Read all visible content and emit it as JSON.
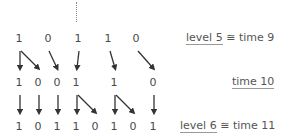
{
  "diagram": {
    "ellipsis": "⋮",
    "rows": [
      {
        "name": "level-5",
        "y": 33,
        "digits": [
          {
            "v": "1",
            "x": 19
          },
          {
            "v": "0",
            "x": 48
          },
          {
            "v": "1",
            "x": 78
          },
          {
            "v": "1",
            "x": 108
          },
          {
            "v": "0",
            "x": 136
          }
        ],
        "label": {
          "prefix": "level",
          "num": "5",
          "rel": "≅ time 9",
          "x": 186
        }
      },
      {
        "name": "time-10",
        "y": 77,
        "digits": [
          {
            "v": "1",
            "x": 19
          },
          {
            "v": "0",
            "x": 38
          },
          {
            "v": "0",
            "x": 57
          },
          {
            "v": "1",
            "x": 76
          },
          {
            "v": "1",
            "x": 114
          },
          {
            "v": "0",
            "x": 153
          }
        ],
        "label": {
          "text": "time 10",
          "x": 232
        }
      },
      {
        "name": "level-6",
        "y": 121,
        "digits": [
          {
            "v": "1",
            "x": 19
          },
          {
            "v": "0",
            "x": 38
          },
          {
            "v": "1",
            "x": 57
          },
          {
            "v": "1",
            "x": 76
          },
          {
            "v": "0",
            "x": 95
          },
          {
            "v": "1",
            "x": 114
          },
          {
            "v": "0",
            "x": 133
          },
          {
            "v": "1",
            "x": 153
          }
        ],
        "label": {
          "prefix": "level",
          "num": "6",
          "rel": "≅ time 11",
          "x": 180
        }
      }
    ],
    "labels": {
      "level5_prefix": "level",
      "level5_num": "5",
      "level5_rel": "≅ time 9",
      "time10": "time 10",
      "level6_prefix": "level",
      "level6_num": "6",
      "level6_rel": "≅ time 11"
    },
    "digits_row1": [
      "1",
      "0",
      "1",
      "1",
      "0"
    ],
    "digits_row2": [
      "1",
      "0",
      "0",
      "1",
      "1",
      "0"
    ],
    "digits_row3": [
      "1",
      "0",
      "1",
      "1",
      "0",
      "1",
      "0",
      "1"
    ],
    "arrow_color": "#333333"
  }
}
